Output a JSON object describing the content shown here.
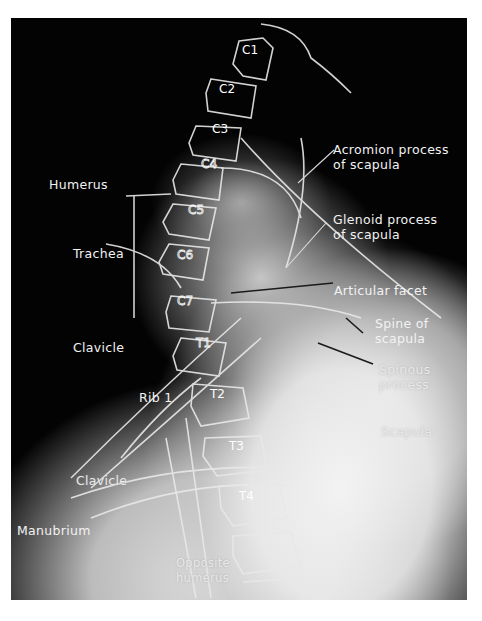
{
  "image": {
    "description": "Lateral radiograph of cervicothoracic spine with anatomical labels"
  },
  "vertebrae": {
    "c1": "C1",
    "c2": "C2",
    "c3": "C3",
    "c4": "C4",
    "c5": "C5",
    "c6": "C6",
    "c7": "C7",
    "t1": "T1",
    "t2": "T2",
    "t3": "T3",
    "t4": "T4"
  },
  "labels": {
    "humerus": "Humerus",
    "trachea": "Trachea",
    "clavicle_upper": "Clavicle",
    "rib1": "Rib 1",
    "clavicle_lower": "Clavicle",
    "manubrium": "Manubrium",
    "opposite_humerus": "Opposite\nhumerus",
    "acromion_process": "Acromion process\nof scapula",
    "glenoid_process": "Glenoid process\nof scapula",
    "articular_facet": "Articular facet",
    "spine_of_scapula": "Spine of\nscapula",
    "spinous_process": "Spinous\nprocess",
    "scapula": "Scapula"
  },
  "colors": {
    "background": "#030303",
    "label_text": "#f2f2f2",
    "leader_line": "#1a1a1a",
    "page": "#ffffff"
  }
}
